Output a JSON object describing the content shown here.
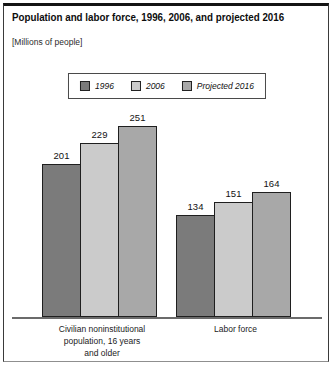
{
  "header": {
    "title": "Population and labor force, 1996, 2006, and projected 2016",
    "subtitle": "[Millions of people]"
  },
  "legend": {
    "items": [
      {
        "label": "1996",
        "color": "#7b7b7b"
      },
      {
        "label": "2006",
        "color": "#cbcbcb"
      },
      {
        "label": "Projected 2016",
        "color": "#a8a8a8"
      }
    ]
  },
  "chart_data": {
    "type": "bar",
    "title": "Population and labor force, 1996, 2006, and projected 2016",
    "units_note": "[Millions of people]",
    "categories": [
      "Civilian noninstitutional population, 16 years and older",
      "Labor force"
    ],
    "category_label_lines": [
      [
        "Civilian noninstitutional",
        "population, 16 years",
        "and older"
      ],
      [
        "Labor force"
      ]
    ],
    "series": [
      {
        "name": "1996",
        "color": "#7b7b7b",
        "values": [
          201,
          134
        ]
      },
      {
        "name": "2006",
        "color": "#cbcbcb",
        "values": [
          229,
          151
        ]
      },
      {
        "name": "Projected 2016",
        "color": "#a8a8a8",
        "values": [
          251,
          164
        ]
      }
    ],
    "ylim": [
      0,
      260
    ],
    "value_labels": true,
    "grid": false,
    "legend_position": "top-center"
  }
}
